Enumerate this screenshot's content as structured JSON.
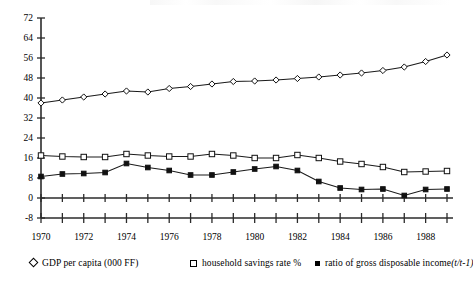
{
  "chart_data": {
    "type": "line",
    "title": "",
    "xlabel": "",
    "ylabel": "",
    "xlim": [
      1970,
      1989
    ],
    "ylim": [
      -8,
      72
    ],
    "y_ticks": [
      -8,
      0,
      8,
      16,
      24,
      32,
      40,
      48,
      56,
      64,
      72
    ],
    "x_ticks_major": [
      1970,
      1972,
      1974,
      1976,
      1978,
      1980,
      1982,
      1984,
      1986,
      1988
    ],
    "x_ticks_all": [
      1970,
      1971,
      1972,
      1973,
      1974,
      1975,
      1976,
      1977,
      1978,
      1979,
      1980,
      1981,
      1982,
      1983,
      1984,
      1985,
      1986,
      1987,
      1988,
      1989
    ],
    "grid": false,
    "legend_position": "bottom",
    "x": [
      1970,
      1971,
      1972,
      1973,
      1974,
      1975,
      1976,
      1977,
      1978,
      1979,
      1980,
      1981,
      1982,
      1983,
      1984,
      1985,
      1986,
      1987,
      1988,
      1989
    ],
    "series": [
      {
        "name": "GDP per capita (000 FF)",
        "marker": "diamond-open",
        "values": [
          38.0,
          39.2,
          40.4,
          41.6,
          42.8,
          42.4,
          43.8,
          44.6,
          45.6,
          46.6,
          46.8,
          47.2,
          47.8,
          48.4,
          49.2,
          50.0,
          51.0,
          52.4,
          54.6,
          57.2
        ]
      },
      {
        "name": "household savings rate %",
        "marker": "square-open",
        "values": [
          17.0,
          16.6,
          16.4,
          16.4,
          17.6,
          17.0,
          16.6,
          16.6,
          17.6,
          17.0,
          16.0,
          16.0,
          17.2,
          16.0,
          14.6,
          13.6,
          12.4,
          10.4,
          10.6,
          10.8
        ]
      },
      {
        "name": "ratio of gross disposable income (t/t-1)",
        "marker": "square-filled",
        "values": [
          8.6,
          9.6,
          9.8,
          10.2,
          13.8,
          12.2,
          11.0,
          9.2,
          9.2,
          10.4,
          11.6,
          12.6,
          11.0,
          6.6,
          4.0,
          3.4,
          3.6,
          1.0,
          3.4,
          3.6
        ]
      }
    ]
  },
  "legend": {
    "items": [
      {
        "marker": "diamond-open",
        "label": "GDP per capita (000 FF)",
        "note": ""
      },
      {
        "marker": "square-open",
        "label": "household savings rate %",
        "note": ""
      },
      {
        "marker": "square-filled",
        "label": "ratio of gross disposable income ",
        "note": "(t/t-1)"
      }
    ]
  },
  "axis": {
    "y_tick_labels": [
      "72",
      "64",
      "56",
      "48",
      "40",
      "32",
      "24",
      "16",
      "8",
      "0",
      "-8"
    ],
    "x_tick_labels": [
      "1970",
      "1972",
      "1974",
      "1976",
      "1978",
      "1980",
      "1982",
      "1984",
      "1986",
      "1988"
    ]
  }
}
